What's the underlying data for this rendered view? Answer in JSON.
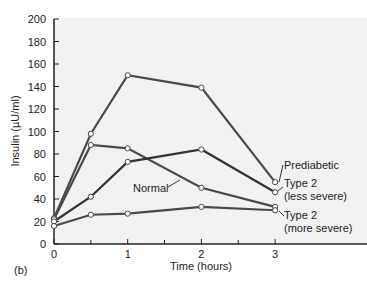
{
  "panel_label": "(b)",
  "chart_data": {
    "type": "line",
    "title": "",
    "xlabel": "Time (hours)",
    "ylabel": "Insulin  (µU/ml)",
    "xlim": [
      0,
      3.8
    ],
    "ylim": [
      0,
      200
    ],
    "x_ticks": [
      0,
      1,
      2,
      3
    ],
    "x_minor_ticks": [
      0.5,
      1.5,
      2.5
    ],
    "y_ticks": [
      0,
      20,
      40,
      60,
      80,
      100,
      120,
      140,
      160,
      180,
      200
    ],
    "grid": false,
    "legend_position": "inline labels at right of lines",
    "x": [
      0,
      0.5,
      1,
      2,
      3
    ],
    "series": [
      {
        "name": "Prediabetic",
        "values": [
          23,
          98,
          150,
          139,
          55
        ],
        "color": "#4a4a4a",
        "label_lines": [
          "Prediabetic"
        ]
      },
      {
        "name": "Normal",
        "values": [
          22,
          88,
          85,
          50,
          33
        ],
        "color": "#4a4a4a",
        "label_lines": [
          "Normal"
        ]
      },
      {
        "name": "Type 2 (less severe)",
        "values": [
          20,
          42,
          73,
          84,
          46
        ],
        "color": "#333333",
        "label_lines": [
          "Type 2",
          "(less severe)"
        ]
      },
      {
        "name": "Type 2 (more severe)",
        "values": [
          16,
          26,
          27,
          33,
          30
        ],
        "color": "#4a4a4a",
        "label_lines": [
          "Type 2",
          "(more severe)"
        ]
      }
    ]
  },
  "colors": {
    "plot_bg": "#f2f2f2",
    "axis": "#222222",
    "line": "#444444",
    "marker_fill": "#ffffff"
  }
}
